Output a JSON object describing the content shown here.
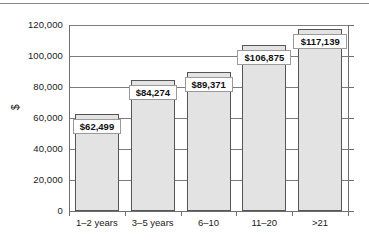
{
  "chart_data": {
    "type": "bar",
    "title": "",
    "xlabel": "",
    "ylabel": "$",
    "categories": [
      "1–2 years",
      "3–5 years",
      "6–10",
      "11–20",
      ">21"
    ],
    "values": [
      62499,
      84274,
      89371,
      106875,
      117139
    ],
    "value_labels": [
      "$62,499",
      "$84,274",
      "$89,371",
      "$106,875",
      "$117,139"
    ],
    "ylim": [
      0,
      120000
    ],
    "ytick_values": [
      0,
      20000,
      40000,
      60000,
      80000,
      100000,
      120000
    ],
    "ytick_labels": [
      "0",
      "20,000",
      "40,000",
      "60,000",
      "80,000",
      "100,000",
      "120,000"
    ],
    "grid": "horizontal",
    "legend": null,
    "bar_fill_color": "#e3e3e3",
    "bar_edge_color": "#555555",
    "axis_color": "#6e6e6e"
  }
}
